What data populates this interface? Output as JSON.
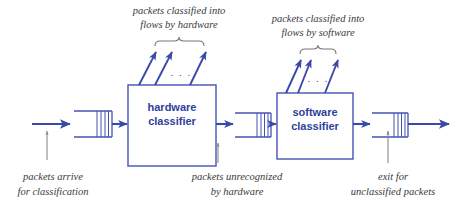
{
  "diagram": {
    "colors": {
      "flow_blue": "#3a49a8",
      "box_stroke": "#4452b5",
      "label_blue": "#2f3f9e",
      "caption_gray": "#3a3a3a",
      "pointer_gray": "#8a8a8a",
      "brace_gray": "#777777",
      "background": "#ffffff"
    },
    "boxes": [
      {
        "id": "hardware-classifier",
        "line1": "hardware",
        "line2": "classifier",
        "x": 128,
        "y": 85,
        "width": 88,
        "height": 81
      },
      {
        "id": "software-classifier",
        "line1": "software",
        "line2": "classifier",
        "x": 277,
        "y": 93,
        "width": 76,
        "height": 66
      }
    ],
    "queues": [
      {
        "id": "input-queue",
        "x": 74,
        "y": 111,
        "width": 38,
        "height": 26
      },
      {
        "id": "middle-queue",
        "x": 235,
        "y": 113,
        "width": 36,
        "height": 24
      },
      {
        "id": "exit-queue",
        "x": 372,
        "y": 113,
        "width": 36,
        "height": 24
      }
    ],
    "callouts": [
      {
        "id": "hardware-flows-callout",
        "line1": "packets classified into",
        "line2": "flows by hardware",
        "ellipsis": ". . ."
      },
      {
        "id": "software-flows-callout",
        "line1": "packets classified into",
        "line2": "flows by software",
        "ellipsis": ". . ."
      }
    ],
    "captions": [
      {
        "id": "packets-arrive-caption",
        "line1": "packets arrive",
        "line2": "for classification"
      },
      {
        "id": "packets-unrecognized-caption",
        "line1": "packets unrecognized",
        "line2": "by hardware"
      },
      {
        "id": "exit-unclassified-caption",
        "line1": "exit for",
        "line2": "unclassified packets"
      }
    ]
  }
}
